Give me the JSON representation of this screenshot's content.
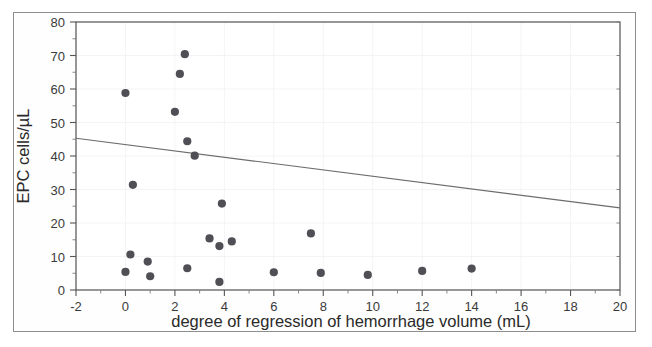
{
  "figure": {
    "background_color": "#ffffff",
    "frame_color": "#8e8e8e",
    "marker_color": "#4f4f55",
    "line_color": "#6c6c6c",
    "grid_color": "#f4f4f4",
    "axis_color": "#555555"
  },
  "chart_data": {
    "type": "scatter",
    "title": "",
    "xlabel": "degree of regression of hemorrhage volume (mL)",
    "ylabel": "EPC cells/µL",
    "xlim": [
      -2,
      20
    ],
    "ylim": [
      0,
      80
    ],
    "xticks": [
      -2,
      0,
      2,
      4,
      6,
      8,
      10,
      12,
      14,
      16,
      18,
      20
    ],
    "xticklabels": [
      "-2",
      "0",
      "2",
      "4",
      "6",
      "8",
      "10",
      "12",
      "14",
      "16",
      "18",
      "20"
    ],
    "yticks": [
      0,
      10,
      20,
      30,
      40,
      50,
      60,
      70,
      80
    ],
    "yticklabels": [
      "0",
      "10",
      "20",
      "30",
      "40",
      "50",
      "60",
      "70",
      "80"
    ],
    "grid": true,
    "legend": "none",
    "marker": "filled-circle",
    "points": [
      {
        "x": 0.0,
        "y": 58.8
      },
      {
        "x": 0.0,
        "y": 5.4
      },
      {
        "x": 0.3,
        "y": 31.4
      },
      {
        "x": 0.2,
        "y": 10.6
      },
      {
        "x": 0.9,
        "y": 8.5
      },
      {
        "x": 1.0,
        "y": 4.1
      },
      {
        "x": 2.0,
        "y": 53.2
      },
      {
        "x": 2.2,
        "y": 64.5
      },
      {
        "x": 2.4,
        "y": 70.4
      },
      {
        "x": 2.5,
        "y": 44.4
      },
      {
        "x": 2.5,
        "y": 6.5
      },
      {
        "x": 2.8,
        "y": 40.1
      },
      {
        "x": 3.4,
        "y": 15.4
      },
      {
        "x": 3.8,
        "y": 13.1
      },
      {
        "x": 3.9,
        "y": 25.8
      },
      {
        "x": 3.8,
        "y": 2.4
      },
      {
        "x": 4.3,
        "y": 14.5
      },
      {
        "x": 6.0,
        "y": 5.3
      },
      {
        "x": 7.5,
        "y": 16.9
      },
      {
        "x": 7.9,
        "y": 5.1
      },
      {
        "x": 9.8,
        "y": 4.5
      },
      {
        "x": 12.0,
        "y": 5.7
      },
      {
        "x": 14.0,
        "y": 6.4
      }
    ],
    "trendline": {
      "type": "linear-fit",
      "x_start": -2,
      "y_start": 45.3,
      "x_end": 20,
      "y_end": 24.5,
      "slope": -0.945,
      "intercept": 43.41
    }
  }
}
